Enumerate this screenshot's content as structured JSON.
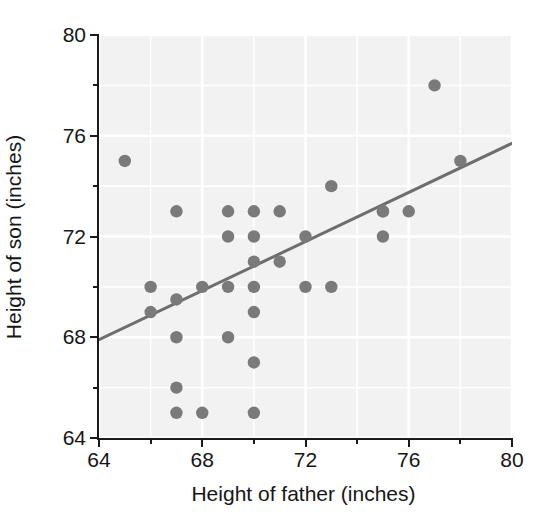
{
  "chart_data": {
    "type": "scatter",
    "title": "",
    "xlabel": "Height of father (inches)",
    "ylabel": "Height of son (inches)",
    "xlim": [
      64,
      80
    ],
    "ylim": [
      64,
      80
    ],
    "xticks": [
      64,
      68,
      72,
      76,
      80
    ],
    "yticks": [
      64,
      68,
      72,
      76,
      80
    ],
    "xticks_minor": [
      66,
      70,
      74,
      78
    ],
    "yticks_minor": [
      66,
      70,
      74,
      78
    ],
    "grid": true,
    "legend": "none",
    "point_color": "#7a7a7a",
    "line_color": "#6e6e6e",
    "plot_bg_color": "#f2f2f2",
    "axis_color": "#1a1a1a",
    "x": [
      65,
      66,
      66,
      67,
      67,
      67,
      67,
      67,
      68,
      68,
      69,
      69,
      69,
      69,
      70,
      70,
      70,
      70,
      70,
      70,
      70,
      71,
      71,
      72,
      72,
      73,
      73,
      75,
      75,
      75,
      76,
      77,
      78
    ],
    "y": [
      75,
      70,
      69,
      73,
      69.5,
      68,
      66,
      65,
      70,
      65,
      73,
      72,
      70,
      68,
      73,
      72,
      71,
      70,
      69,
      67,
      65,
      73,
      71,
      72,
      70,
      74,
      70,
      73,
      73,
      72,
      73,
      78,
      75
    ],
    "points": [
      {
        "x": 65,
        "y": 75
      },
      {
        "x": 66,
        "y": 70
      },
      {
        "x": 66,
        "y": 69
      },
      {
        "x": 67,
        "y": 73
      },
      {
        "x": 67,
        "y": 69.5
      },
      {
        "x": 67,
        "y": 68
      },
      {
        "x": 67,
        "y": 66
      },
      {
        "x": 67,
        "y": 65
      },
      {
        "x": 68,
        "y": 70
      },
      {
        "x": 68,
        "y": 65
      },
      {
        "x": 69,
        "y": 73
      },
      {
        "x": 69,
        "y": 72
      },
      {
        "x": 69,
        "y": 70
      },
      {
        "x": 69,
        "y": 68
      },
      {
        "x": 70,
        "y": 73
      },
      {
        "x": 70,
        "y": 72
      },
      {
        "x": 70,
        "y": 71
      },
      {
        "x": 70,
        "y": 70
      },
      {
        "x": 70,
        "y": 69
      },
      {
        "x": 70,
        "y": 67
      },
      {
        "x": 70,
        "y": 65
      },
      {
        "x": 71,
        "y": 73
      },
      {
        "x": 71,
        "y": 71
      },
      {
        "x": 72,
        "y": 72
      },
      {
        "x": 72,
        "y": 70
      },
      {
        "x": 73,
        "y": 74
      },
      {
        "x": 73,
        "y": 70
      },
      {
        "x": 75,
        "y": 73
      },
      {
        "x": 75,
        "y": 73
      },
      {
        "x": 75,
        "y": 72
      },
      {
        "x": 76,
        "y": 73
      },
      {
        "x": 77,
        "y": 78
      },
      {
        "x": 78,
        "y": 75
      }
    ],
    "trendline": {
      "x0": 64,
      "y0": 67.9,
      "x1": 80,
      "y1": 75.7
    }
  }
}
